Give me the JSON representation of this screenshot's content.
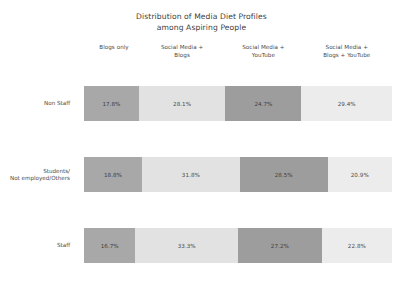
{
  "chart_data": {
    "type": "bar",
    "orientation": "horizontal",
    "stacked": true,
    "normalized": true,
    "title": "Distribution of Media Diet Profiles among Aspiring People",
    "title_lines": [
      "Distribution of Media Diet Profiles",
      "among Aspiring People"
    ],
    "xlabel": "",
    "ylabel": "",
    "xlim": [
      0,
      100
    ],
    "grid": false,
    "legend_position": "top",
    "value_suffix": "%",
    "categories": [
      "Non Staff",
      "Students/ Not employed/Others",
      "Staff"
    ],
    "category_lines": [
      [
        "Non Staff"
      ],
      [
        "Students/",
        "Not employed/Others"
      ],
      [
        "Staff"
      ]
    ],
    "series": [
      {
        "name": "Blogs only",
        "name_lines": [
          "Blogs only"
        ],
        "color": "#a8a8a8",
        "values": [
          17.8,
          18.8,
          16.7
        ],
        "labels": [
          "17.8%",
          "18.8%",
          "16.7%"
        ]
      },
      {
        "name": "Social Media + Blogs",
        "name_lines": [
          "Social Media +",
          "Blogs"
        ],
        "color": "#e2e2e2",
        "values": [
          28.1,
          31.8,
          33.3
        ],
        "labels": [
          "28.1%",
          "31.8%",
          "33.3%"
        ]
      },
      {
        "name": "Social Media + YouTube",
        "name_lines": [
          "Social Media +",
          "YouTube"
        ],
        "color": "#9d9d9d",
        "values": [
          24.7,
          28.5,
          27.2
        ],
        "labels": [
          "24.7%",
          "28.5%",
          "27.2%"
        ]
      },
      {
        "name": "Social Media + Blogs + YouTube",
        "name_lines": [
          "Social Media +",
          "Blogs + YouTube"
        ],
        "color": "#ececec",
        "values": [
          29.4,
          20.9,
          22.8
        ],
        "labels": [
          "29.4%",
          "20.9%",
          "22.8%"
        ]
      }
    ]
  },
  "colors": {
    "background": "#ffffff",
    "text": "#3c3c3c",
    "label_text": "#4a4a4a",
    "segment_1": "#a8a8a8",
    "segment_2": "#e2e2e2",
    "segment_3": "#9d9d9d",
    "segment_4": "#ececec"
  }
}
